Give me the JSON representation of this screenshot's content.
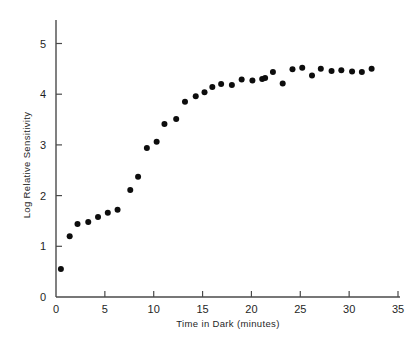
{
  "chart_data": {
    "type": "scatter",
    "title": "",
    "subtitle": "",
    "xlabel": "Time in Dark (minutes)",
    "ylabel": "Log Relative Sensitivity",
    "xlim": [
      0,
      35
    ],
    "ylim": [
      0,
      5.25
    ],
    "xticks": [
      0,
      5,
      10,
      15,
      20,
      25,
      30,
      35
    ],
    "xtick_labels": [
      "0",
      "5",
      "10",
      "15",
      "20",
      "25",
      "30",
      "35"
    ],
    "yticks": [
      0,
      1,
      2,
      3,
      4,
      5
    ],
    "ytick_labels": [
      "0",
      "1",
      "2",
      "3",
      "4",
      "5"
    ],
    "grid": false,
    "legend": false,
    "legend_position": "none",
    "annotations": [],
    "marker": {
      "shape": "circle",
      "color": "#0d0d0d",
      "size_px": 6
    },
    "series": [
      {
        "name": "Dark adaptation",
        "color": "#0d0d0d",
        "points": [
          [
            0.5,
            0.55
          ],
          [
            1.4,
            1.2
          ],
          [
            2.2,
            1.44
          ],
          [
            3.3,
            1.48
          ],
          [
            4.3,
            1.58
          ],
          [
            5.3,
            1.66
          ],
          [
            6.3,
            1.72
          ],
          [
            7.6,
            2.11
          ],
          [
            8.4,
            2.37
          ],
          [
            9.3,
            2.94
          ],
          [
            10.3,
            3.06
          ],
          [
            11.1,
            3.41
          ],
          [
            12.3,
            3.51
          ],
          [
            13.2,
            3.85
          ],
          [
            14.3,
            3.96
          ],
          [
            15.2,
            4.04
          ],
          [
            16.0,
            4.14
          ],
          [
            16.9,
            4.2
          ],
          [
            18.0,
            4.18
          ],
          [
            19.0,
            4.29
          ],
          [
            20.1,
            4.27
          ],
          [
            21.1,
            4.3
          ],
          [
            21.4,
            4.32
          ],
          [
            22.2,
            4.44
          ],
          [
            23.2,
            4.21
          ],
          [
            24.2,
            4.49
          ],
          [
            25.2,
            4.52
          ],
          [
            26.2,
            4.37
          ],
          [
            27.1,
            4.5
          ],
          [
            28.2,
            4.46
          ],
          [
            29.2,
            4.47
          ],
          [
            30.3,
            4.45
          ],
          [
            31.3,
            4.44
          ],
          [
            32.3,
            4.5
          ]
        ]
      }
    ]
  },
  "axes": {
    "x_axis_label": "Time in Dark (minutes)",
    "y_axis_label": "Log Relative Sensitivity"
  }
}
